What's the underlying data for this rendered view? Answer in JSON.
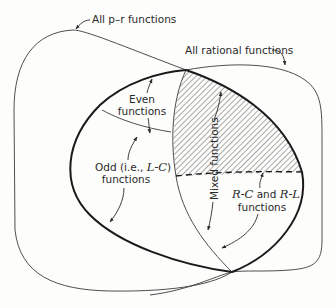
{
  "diagram": {
    "labels": {
      "all_pr": "All p–r functions",
      "all_rational": "All rational functions",
      "even_1": "Even",
      "even_2": "functions",
      "odd_1a": "Odd (i.e., ",
      "odd_1b": "L-C",
      "odd_1c": ")",
      "odd_2": "functions",
      "mixed": "Mixed functions",
      "rc_1a": "R-C",
      "rc_1b": " and ",
      "rc_1c": "R-L",
      "rc_2": "functions"
    },
    "colors": {
      "line": "#3a3a3a",
      "thick_line": "#1a1a1a",
      "hatch": "#555555",
      "background": "#fdfdfc"
    },
    "regions": [
      "All p-r functions",
      "All rational functions",
      "Even functions",
      "Odd (i.e., L-C) functions",
      "Mixed functions",
      "R-C and R-L functions"
    ]
  }
}
